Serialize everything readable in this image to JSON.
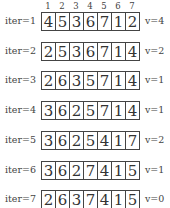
{
  "indices": [
    "1",
    "2",
    "3",
    "4",
    "5",
    "6",
    "7"
  ],
  "rows": [
    {
      "label": "iter=1",
      "cells": [
        "4",
        "5",
        "3",
        "6",
        "7",
        "1",
        "2"
      ],
      "v": "v=4"
    },
    {
      "label": "iter=2",
      "cells": [
        "2",
        "5",
        "3",
        "6",
        "7",
        "1",
        "4"
      ],
      "v": "v=2"
    },
    {
      "label": "iter=3",
      "cells": [
        "2",
        "6",
        "3",
        "5",
        "7",
        "1",
        "4"
      ],
      "v": "v=1"
    },
    {
      "label": "iter=4",
      "cells": [
        "3",
        "6",
        "2",
        "5",
        "7",
        "1",
        "4"
      ],
      "v": "v=1"
    },
    {
      "label": "iter=5",
      "cells": [
        "3",
        "6",
        "2",
        "5",
        "4",
        "1",
        "7"
      ],
      "v": "v=2"
    },
    {
      "label": "iter=6",
      "cells": [
        "3",
        "6",
        "2",
        "7",
        "4",
        "1",
        "5"
      ],
      "v": "v=1"
    },
    {
      "label": "iter=7",
      "cells": [
        "2",
        "6",
        "3",
        "7",
        "4",
        "1",
        "5"
      ],
      "v": "v=0"
    }
  ]
}
